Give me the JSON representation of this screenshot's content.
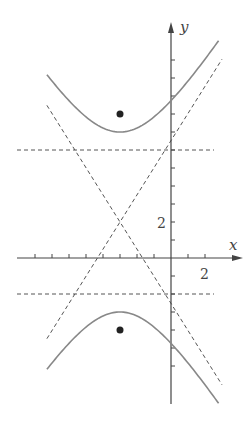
{
  "diagram": {
    "type": "hyperbola",
    "orientation": "vertical",
    "center": [
      -3,
      2
    ],
    "a": 5,
    "c": 6,
    "b_squared": 11,
    "vertices": [
      [
        -3,
        7
      ],
      [
        -3,
        -3
      ]
    ],
    "foci": [
      [
        -3,
        8
      ],
      [
        -3,
        -4
      ]
    ],
    "directrices": [
      6,
      -2
    ],
    "asymptote_slope": 1.508,
    "axes": {
      "x_label": "x",
      "y_label": "y",
      "x_tick_label": "2",
      "y_tick_label": "2",
      "x_range": [
        -8,
        2.9
      ],
      "y_range": [
        -6,
        11.5
      ]
    },
    "colors": {
      "curve": "#888888",
      "dashed": "#555555",
      "axis": "#444444",
      "focus": "#222222"
    }
  }
}
